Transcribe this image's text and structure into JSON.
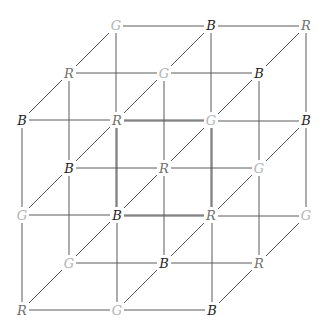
{
  "diagram": {
    "type": "3x3x3 lattice cube coloring",
    "colors": {
      "R": "#707070",
      "G": "#b4b4b4",
      "B": "#1e1e1e",
      "edge": "#5a5a5a"
    },
    "layers": {
      "front": {
        "offset": [
          0,
          0
        ],
        "rows": [
          [
            "B",
            "R",
            "G"
          ],
          [
            "G",
            "B",
            "R"
          ],
          [
            "R",
            "G",
            "B"
          ]
        ]
      },
      "middle": {
        "offset": [
          47,
          -47
        ],
        "rows": [
          [
            "R",
            "G",
            "B"
          ],
          [
            "B",
            "R",
            "G"
          ],
          [
            "G",
            "B",
            "R"
          ]
        ]
      },
      "back": {
        "offset": [
          94,
          -94
        ],
        "rows": [
          [
            "G",
            "B",
            "R"
          ],
          [
            "R",
            "G",
            "B"
          ],
          [
            "B",
            "R",
            "G"
          ]
        ]
      }
    },
    "visible_labels": [
      {
        "x": 116,
        "y": 25,
        "label": "G"
      },
      {
        "x": 211,
        "y": 25,
        "label": "B"
      },
      {
        "x": 306,
        "y": 25,
        "label": "R"
      },
      {
        "x": 69,
        "y": 73,
        "label": "R"
      },
      {
        "x": 164,
        "y": 73,
        "label": "G"
      },
      {
        "x": 259,
        "y": 73,
        "label": "B"
      },
      {
        "x": 22,
        "y": 120,
        "label": "B"
      },
      {
        "x": 117,
        "y": 120,
        "label": "R"
      },
      {
        "x": 211,
        "y": 120,
        "label": "G"
      },
      {
        "x": 306,
        "y": 120,
        "label": "B"
      },
      {
        "x": 69,
        "y": 168,
        "label": "B"
      },
      {
        "x": 164,
        "y": 168,
        "label": "R"
      },
      {
        "x": 259,
        "y": 168,
        "label": "G"
      },
      {
        "x": 22,
        "y": 215,
        "label": "G"
      },
      {
        "x": 117,
        "y": 215,
        "label": "B"
      },
      {
        "x": 211,
        "y": 215,
        "label": "R"
      },
      {
        "x": 306,
        "y": 215,
        "label": "G"
      },
      {
        "x": 69,
        "y": 263,
        "label": "G"
      },
      {
        "x": 164,
        "y": 263,
        "label": "B"
      },
      {
        "x": 259,
        "y": 263,
        "label": "R"
      },
      {
        "x": 22,
        "y": 310,
        "label": "R"
      },
      {
        "x": 117,
        "y": 310,
        "label": "G"
      },
      {
        "x": 212,
        "y": 310,
        "label": "B"
      }
    ]
  }
}
